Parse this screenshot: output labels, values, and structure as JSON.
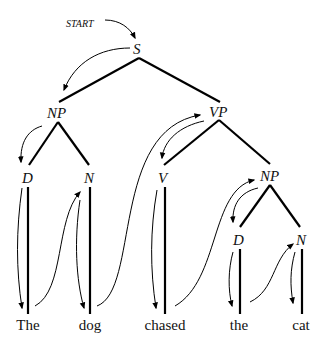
{
  "diagram": {
    "type": "parse-tree",
    "start_label": "START",
    "nodes": {
      "S": "S",
      "NP1": "NP",
      "VP": "VP",
      "D1": "D",
      "N1": "N",
      "V": "V",
      "NP2": "NP",
      "D2": "D",
      "N2": "N"
    },
    "words": [
      "The",
      "dog",
      "chased",
      "the",
      "cat"
    ],
    "traversal": "depth-first, left-to-right"
  }
}
